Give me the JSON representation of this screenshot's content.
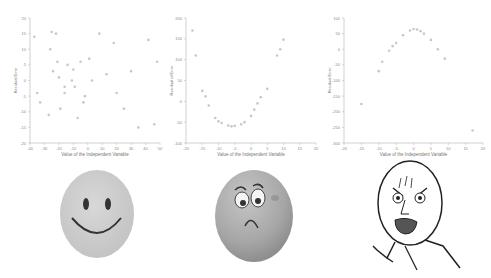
{
  "chart_data": [
    {
      "type": "scatter",
      "title": "",
      "xlabel": "Value of the Independent Variable",
      "ylabel": "Residual Error",
      "xlim": [
        -40,
        50
      ],
      "ylim": [
        -20,
        20
      ],
      "xticks": [
        "-40",
        "-30",
        "-20",
        "-10",
        "0",
        "10",
        "20",
        "30",
        "40",
        "50"
      ],
      "yticks": [
        "-20",
        "-15",
        "-10",
        "-5",
        "0",
        "5",
        "10",
        "15",
        "20"
      ],
      "grid": false,
      "legend": null,
      "points": [
        [
          -37,
          14
        ],
        [
          -35,
          -4
        ],
        [
          -33,
          -7
        ],
        [
          -27,
          -11
        ],
        [
          -26,
          10
        ],
        [
          -25,
          15.5
        ],
        [
          -24,
          3
        ],
        [
          -22,
          15
        ],
        [
          -21,
          6
        ],
        [
          -20,
          1
        ],
        [
          -19,
          -9
        ],
        [
          -16,
          -2
        ],
        [
          -16,
          -4
        ],
        [
          -14,
          5
        ],
        [
          -11,
          0
        ],
        [
          -10,
          3.5
        ],
        [
          -9,
          -2
        ],
        [
          -7,
          -12
        ],
        [
          -5,
          6
        ],
        [
          -3,
          -7
        ],
        [
          -2,
          -5
        ],
        [
          1,
          7
        ],
        [
          3,
          0
        ],
        [
          8,
          15
        ],
        [
          13,
          2
        ],
        [
          18,
          12
        ],
        [
          20,
          -4
        ],
        [
          25,
          -9
        ],
        [
          30,
          3
        ],
        [
          35,
          -15
        ],
        [
          42,
          13
        ],
        [
          46,
          -14
        ],
        [
          48,
          6
        ]
      ]
    },
    {
      "type": "scatter",
      "title": "",
      "xlabel": "Value of the Independent Variable",
      "ylabel": "Residual of Error",
      "xlim": [
        -20,
        20
      ],
      "ylim": [
        -100,
        200
      ],
      "xticks": [
        "-20",
        "-15",
        "-10",
        "-5",
        "0",
        "5",
        "10",
        "15",
        "20"
      ],
      "yticks": [
        "-100",
        "-50",
        "0",
        "50",
        "100",
        "150",
        "200"
      ],
      "grid": false,
      "legend": null,
      "points": [
        [
          -18,
          170
        ],
        [
          -17,
          110
        ],
        [
          -15,
          25
        ],
        [
          -14,
          12
        ],
        [
          -13,
          -10
        ],
        [
          -11,
          -40
        ],
        [
          -10,
          -48
        ],
        [
          -9,
          -52
        ],
        [
          -7,
          -58
        ],
        [
          -6,
          -60
        ],
        [
          -5,
          -59
        ],
        [
          -3,
          -55
        ],
        [
          -2,
          -50
        ],
        [
          0,
          -35
        ],
        [
          1,
          -20
        ],
        [
          2,
          -5
        ],
        [
          3,
          10
        ],
        [
          5,
          30
        ],
        [
          8,
          110
        ],
        [
          9,
          125
        ],
        [
          10,
          148
        ]
      ]
    },
    {
      "type": "scatter",
      "title": "",
      "xlabel": "Value of the Independent Variable",
      "ylabel": "Residual Error",
      "xlim": [
        -20,
        20
      ],
      "ylim": [
        -300,
        100
      ],
      "xticks": [
        "-20",
        "-15",
        "-10",
        "-5",
        "0",
        "5",
        "10",
        "15",
        "20"
      ],
      "yticks": [
        "-300",
        "-250",
        "-200",
        "-150",
        "-100",
        "-50",
        "0",
        "50",
        "100"
      ],
      "grid": false,
      "legend": null,
      "points": [
        [
          -15,
          -175
        ],
        [
          -10,
          -70
        ],
        [
          -9,
          -40
        ],
        [
          -7,
          -5
        ],
        [
          -6,
          10
        ],
        [
          -5,
          20
        ],
        [
          -3,
          45
        ],
        [
          -1,
          60
        ],
        [
          0,
          65
        ],
        [
          1,
          63
        ],
        [
          2,
          58
        ],
        [
          3,
          50
        ],
        [
          5,
          30
        ],
        [
          7,
          0
        ],
        [
          9,
          -30
        ],
        [
          17,
          -260
        ]
      ]
    }
  ],
  "faces": [
    {
      "label": "happy-face",
      "emotion": "happy"
    },
    {
      "label": "sad-face",
      "emotion": "sad"
    },
    {
      "label": "y-u-no-face",
      "emotion": "angry"
    }
  ],
  "colors": {
    "axis": "#bdbdbd",
    "tick_text": "#8a8a8a",
    "point": "#c8c8c8",
    "happy_fill": "#cfcfcf",
    "sad_fill": "#a8a8a8",
    "line": "#3a3a3a"
  }
}
